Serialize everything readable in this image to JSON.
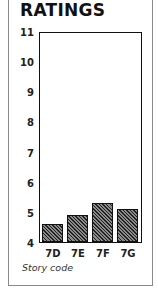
{
  "chart_data": {
    "type": "bar",
    "title": "RATINGS",
    "categories": [
      "7D",
      "7E",
      "7F",
      "7G"
    ],
    "values": [
      4.6,
      4.9,
      5.3,
      5.1
    ],
    "xlabel": "Story code",
    "ylabel": "",
    "ylim": [
      4,
      11
    ],
    "yticks": [
      4,
      5,
      6,
      7,
      8,
      9,
      10,
      11
    ],
    "grid": false,
    "legend": null,
    "bar_fill": "hatched dark gray"
  }
}
